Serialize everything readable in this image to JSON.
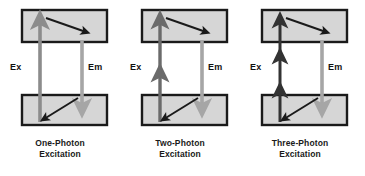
{
  "figure": {
    "background_color": "#ffffff",
    "width": 365,
    "height": 176
  },
  "style": {
    "box_fill": "#d6d6d6",
    "box_border": "#1a1a1a",
    "excitation_arrow_color_single": "#8c8c8c",
    "excitation_arrow_color_multi": "#4d4d4d",
    "emission_arrow_color": "#a6a6a6",
    "relaxation_arrow_color": "#1a1a1a",
    "text_color": "#1a1a1a"
  },
  "panels": [
    {
      "id": "one-photon",
      "caption_line1": "One-Photon",
      "caption_line2": "Excitation",
      "excitation_label": "Ex",
      "emission_label": "Em",
      "excitation_photons": 1,
      "excitation_arrow_color": "#8c8c8c",
      "emission_arrow_color": "#a6a6a6",
      "ground_state_box": {
        "x": 22,
        "y": 95,
        "width": 85,
        "height": 30
      },
      "excited_state_box": {
        "x": 22,
        "y": 10,
        "width": 85,
        "height": 32
      },
      "excitation_arrow": {
        "x": 40,
        "y_bottom": 122,
        "y_top": 20
      },
      "emission_arrow": {
        "x": 82,
        "y_top": 40,
        "y_bottom": 108
      },
      "relaxation_top": {
        "x1": 46,
        "y1": 18,
        "x2": 86,
        "y2": 32
      },
      "relaxation_bottom": {
        "x1": 78,
        "y1": 98,
        "x2": 44,
        "y2": 119
      }
    },
    {
      "id": "two-photon",
      "caption_line1": "Two-Photon",
      "caption_line2": "Excitation",
      "excitation_label": "Ex",
      "emission_label": "Em",
      "excitation_photons": 2,
      "excitation_arrow_color": "#6b6b6b",
      "emission_arrow_color": "#a6a6a6",
      "ground_state_box": {
        "x": 22,
        "y": 95,
        "width": 85,
        "height": 30
      },
      "excited_state_box": {
        "x": 22,
        "y": 10,
        "width": 85,
        "height": 32
      },
      "excitation_arrow": {
        "x": 40,
        "y_bottom": 122,
        "y_top": 20
      },
      "emission_arrow": {
        "x": 82,
        "y_top": 40,
        "y_bottom": 108
      },
      "relaxation_top": {
        "x1": 46,
        "y1": 18,
        "x2": 86,
        "y2": 32
      },
      "relaxation_bottom": {
        "x1": 78,
        "y1": 98,
        "x2": 44,
        "y2": 119
      }
    },
    {
      "id": "three-photon",
      "caption_line1": "Three-Photon",
      "caption_line2": "Excitation",
      "excitation_label": "Ex",
      "emission_label": "Em",
      "excitation_photons": 3,
      "excitation_arrow_color": "#333333",
      "emission_arrow_color": "#a6a6a6",
      "ground_state_box": {
        "x": 22,
        "y": 95,
        "width": 85,
        "height": 30
      },
      "excited_state_box": {
        "x": 22,
        "y": 10,
        "width": 85,
        "height": 32
      },
      "excitation_arrow": {
        "x": 40,
        "y_bottom": 122,
        "y_top": 20
      },
      "emission_arrow": {
        "x": 82,
        "y_top": 40,
        "y_bottom": 108
      },
      "relaxation_top": {
        "x1": 46,
        "y1": 18,
        "x2": 86,
        "y2": 32
      },
      "relaxation_bottom": {
        "x1": 78,
        "y1": 98,
        "x2": 44,
        "y2": 119
      }
    }
  ],
  "panel_offsets": [
    0,
    120,
    240
  ]
}
